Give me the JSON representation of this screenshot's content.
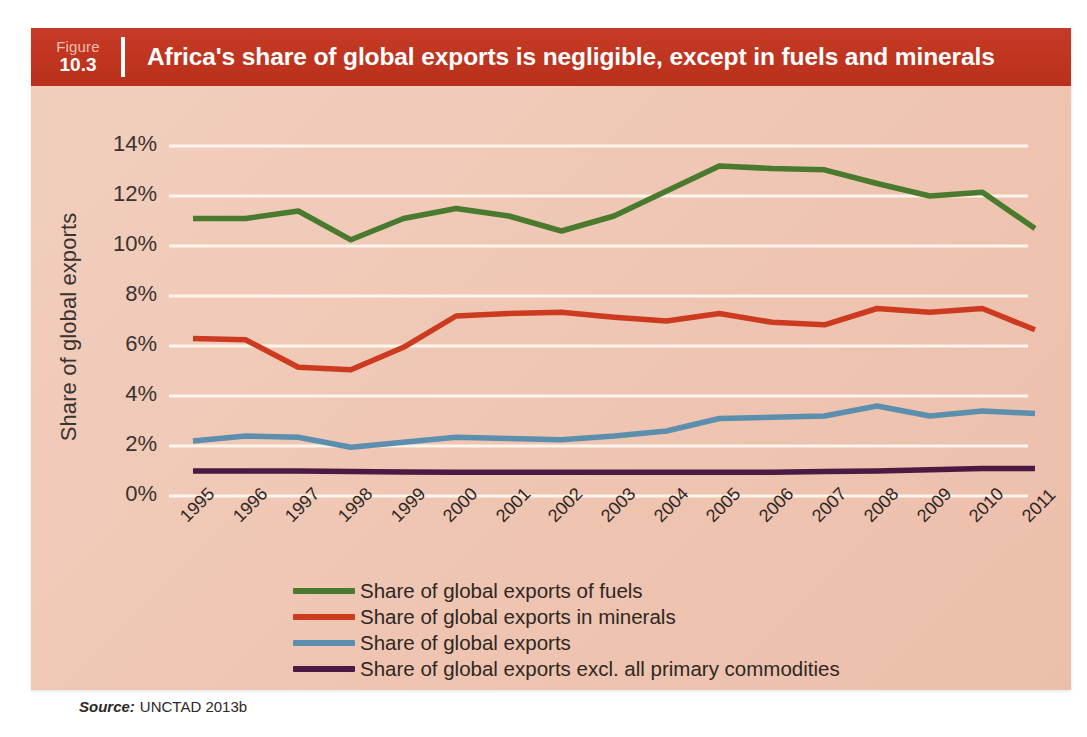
{
  "figure": {
    "label": "Figure",
    "number": "10.3",
    "title": "Africa's share of global exports is negligible, except in fuels and minerals",
    "header_color": "#c0351f"
  },
  "source": {
    "prefix": "Source:",
    "text": "UNCTAD 2013b"
  },
  "chart_data": {
    "type": "line",
    "title": "Africa's share of global exports is negligible, except in fuels and minerals",
    "xlabel": "",
    "ylabel": "Share of global exports",
    "ylim": [
      0,
      15
    ],
    "ytick_values": [
      0,
      2,
      4,
      6,
      8,
      10,
      12,
      14
    ],
    "ytick_labels": [
      "0%",
      "2%",
      "4%",
      "6%",
      "8%",
      "10%",
      "12%",
      "14%"
    ],
    "grid": "horizontal",
    "legend_position": "bottom",
    "x": [
      "1995",
      "1996",
      "1997",
      "1998",
      "1999",
      "2000",
      "2001",
      "2002",
      "2003",
      "2004",
      "2005",
      "2006",
      "2007",
      "2008",
      "2009",
      "2010",
      "2011"
    ],
    "categories": [
      "1995",
      "1996",
      "1997",
      "1998",
      "1999",
      "2000",
      "2001",
      "2002",
      "2003",
      "2004",
      "2005",
      "2006",
      "2007",
      "2008",
      "2009",
      "2010",
      "2011"
    ],
    "series": [
      {
        "name": "Share of global exports of fuels",
        "color": "#4a7a2e",
        "values": [
          11.1,
          11.1,
          11.4,
          10.25,
          11.1,
          11.5,
          11.2,
          10.6,
          11.2,
          12.2,
          13.2,
          13.1,
          13.05,
          12.5,
          12.0,
          12.15,
          10.7
        ]
      },
      {
        "name": "Share of global exports in minerals",
        "color": "#cc3a20",
        "values": [
          6.3,
          6.25,
          5.15,
          5.05,
          5.95,
          7.2,
          7.3,
          7.35,
          7.15,
          7.0,
          7.3,
          6.95,
          6.85,
          7.5,
          7.35,
          7.5,
          6.65
        ]
      },
      {
        "name": "Share of global exports",
        "color": "#5b8fad",
        "values": [
          2.2,
          2.4,
          2.35,
          1.95,
          2.15,
          2.35,
          2.3,
          2.25,
          2.4,
          2.6,
          3.1,
          3.15,
          3.2,
          3.6,
          3.2,
          3.4,
          3.3
        ]
      },
      {
        "name": "Share of global exports excl. all primary commodities",
        "color": "#4a1a42",
        "values": [
          1.0,
          1.0,
          1.0,
          0.98,
          0.96,
          0.95,
          0.95,
          0.95,
          0.95,
          0.95,
          0.95,
          0.95,
          0.98,
          1.0,
          1.05,
          1.1,
          1.1
        ]
      }
    ]
  }
}
